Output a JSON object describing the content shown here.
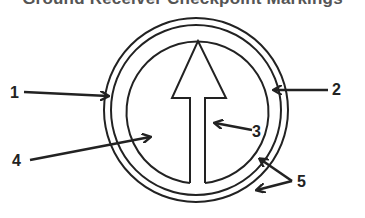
{
  "title": "Ground Receiver Checkpoint Markings",
  "colors": {
    "stroke": "#222222",
    "background": "#ffffff",
    "title": "#555555"
  },
  "diagram": {
    "shapes": [
      {
        "id": "outer-circle",
        "type": "circle",
        "cx": 196,
        "cy": 110,
        "r": 92
      },
      {
        "id": "middle-circle",
        "type": "circle",
        "cx": 196,
        "cy": 110,
        "r": 85
      },
      {
        "id": "inner-circle",
        "type": "circle",
        "cx": 196,
        "cy": 112,
        "r": 71
      },
      {
        "id": "north-arrow",
        "type": "arrow",
        "direction": "up"
      }
    ],
    "labels": [
      {
        "id": "1",
        "text": "1",
        "points_to": "outer-circle (left side)"
      },
      {
        "id": "2",
        "text": "2",
        "points_to": "middle/inner circle (right side)"
      },
      {
        "id": "3",
        "text": "3",
        "points_to": "arrow shaft"
      },
      {
        "id": "4",
        "text": "4",
        "points_to": "inside of inner circle (left of arrow)"
      },
      {
        "id": "5",
        "text": "5",
        "points_to": "gaps between circles (lower right)"
      }
    ]
  }
}
